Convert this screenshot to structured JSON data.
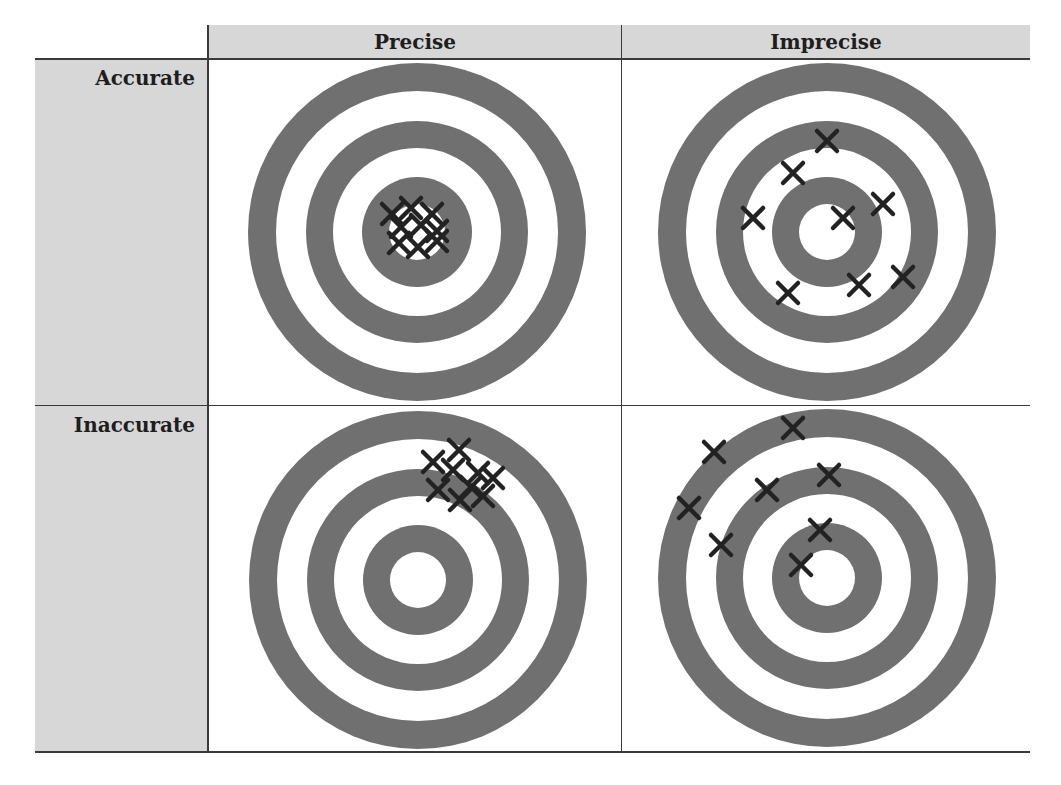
{
  "columns": [
    {
      "label": "Precise"
    },
    {
      "label": "Imprecise"
    }
  ],
  "rows": [
    {
      "label": "Accurate"
    },
    {
      "label": "Inaccurate"
    }
  ],
  "colors": {
    "header_bg": "#d7d7d7",
    "ring_gray": "#707070",
    "ring_white": "#ffffff",
    "mark": "#222222",
    "grid_line": "#3a3a3a"
  },
  "targets": [
    {
      "name": "accurate-precise",
      "cx": 417,
      "cy": 232,
      "marks": [
        [
          392,
          214
        ],
        [
          411,
          208
        ],
        [
          432,
          214
        ],
        [
          401,
          227
        ],
        [
          421,
          225
        ],
        [
          437,
          231
        ],
        [
          399,
          243
        ],
        [
          418,
          247
        ],
        [
          437,
          241
        ]
      ]
    },
    {
      "name": "accurate-imprecise",
      "cx": 827,
      "cy": 232,
      "marks": [
        [
          827,
          141
        ],
        [
          793,
          173
        ],
        [
          753,
          218
        ],
        [
          843,
          218
        ],
        [
          883,
          204
        ],
        [
          788,
          293
        ],
        [
          859,
          285
        ],
        [
          903,
          277
        ]
      ]
    },
    {
      "name": "inaccurate-precise",
      "cx": 418,
      "cy": 580,
      "marks": [
        [
          459,
          450
        ],
        [
          433,
          462
        ],
        [
          453,
          470
        ],
        [
          478,
          473
        ],
        [
          493,
          478
        ],
        [
          438,
          490
        ],
        [
          460,
          500
        ],
        [
          483,
          496
        ],
        [
          471,
          487
        ]
      ]
    },
    {
      "name": "inaccurate-imprecise",
      "cx": 827,
      "cy": 578,
      "marks": [
        [
          793,
          428
        ],
        [
          714,
          452
        ],
        [
          829,
          475
        ],
        [
          767,
          490
        ],
        [
          689,
          508
        ],
        [
          820,
          530
        ],
        [
          721,
          545
        ],
        [
          801,
          565
        ]
      ]
    }
  ],
  "ring_radii": [
    169,
    141,
    111,
    84,
    55,
    28
  ]
}
